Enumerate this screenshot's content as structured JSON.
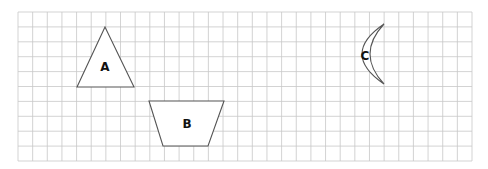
{
  "grid": {
    "x0": 18,
    "y0": 12,
    "x1": 472,
    "y1": 161,
    "cols": 31,
    "rows": 10,
    "line_color": "#c8c8c8"
  },
  "shapes": [
    {
      "id": "A",
      "label": "A",
      "kind": "triangle",
      "points": "105,27 77,87 134,87",
      "label_pos": [
        105,
        71
      ]
    },
    {
      "id": "B",
      "label": "B",
      "kind": "trapezoid",
      "points": "149,101 224,101 208,146 163,146",
      "label_pos": [
        187,
        128
      ]
    },
    {
      "id": "C",
      "label": "C",
      "kind": "crescent",
      "path": "M384,24 Q340,54 384,84 Q356,54 384,24 Z",
      "label_pos": [
        365,
        60
      ]
    }
  ]
}
